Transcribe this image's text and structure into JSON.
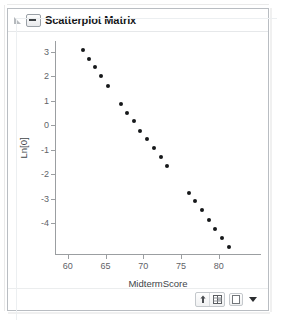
{
  "panel": {
    "title": "Scatterplot Matrix",
    "disclosure_icon": "triangle-collapse-icon",
    "collapse_icon": "minus-box-icon"
  },
  "toolbar": {
    "buttons": [
      {
        "name": "pointer-arrow-icon",
        "glyph": "arrow"
      },
      {
        "name": "grid-table-icon",
        "glyph": "grid"
      },
      {
        "name": "blank-page-icon",
        "glyph": "blank"
      },
      {
        "name": "dropdown-caret-icon",
        "glyph": "caret"
      }
    ]
  },
  "colors": {
    "point": "#16181a",
    "axis": "#9b9ea1",
    "tick_label": "#5f6368",
    "axis_label": "#404448",
    "panel_border": "#b9bdc2",
    "title": "#15171a"
  },
  "chart_data": {
    "type": "scatter",
    "title": "",
    "xlabel": "MidtermScore",
    "ylabel": "Ln[0]",
    "xlim": [
      58.3,
      85.6
    ],
    "ylim": [
      -5.3,
      3.45
    ],
    "xticks": [
      60,
      65,
      70,
      75,
      80
    ],
    "yticks": [
      3,
      2,
      1,
      0,
      -1,
      -2,
      -3,
      -4
    ],
    "grid": false,
    "legend": null,
    "series": [
      {
        "name": "Ln[0] vs MidtermScore",
        "points": [
          [
            62.0,
            3.07
          ],
          [
            62.8,
            2.72
          ],
          [
            63.6,
            2.38
          ],
          [
            64.4,
            2.01
          ],
          [
            65.3,
            1.63
          ],
          [
            67.0,
            0.86
          ],
          [
            67.9,
            0.51
          ],
          [
            68.8,
            0.16
          ],
          [
            69.6,
            -0.21
          ],
          [
            70.5,
            -0.57
          ],
          [
            71.4,
            -0.93
          ],
          [
            72.3,
            -1.3
          ],
          [
            73.2,
            -1.65
          ],
          [
            76.0,
            -2.76
          ],
          [
            76.9,
            -3.11
          ],
          [
            77.8,
            -3.47
          ],
          [
            78.7,
            -3.85
          ],
          [
            79.5,
            -4.25
          ],
          [
            80.4,
            -4.62
          ],
          [
            81.3,
            -4.97
          ]
        ]
      }
    ]
  }
}
